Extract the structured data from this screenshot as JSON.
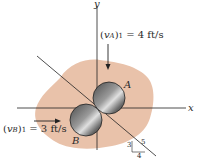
{
  "diagram": {
    "axes": {
      "x_label": "x",
      "y_label": "y"
    },
    "ball_a": {
      "label": "A",
      "velocity_label": "(v_A)_1 = 4 ft/s",
      "velocity_var": "v",
      "velocity_sub": "A",
      "velocity_index": "1",
      "velocity_value": "= 4 ft/s"
    },
    "ball_b": {
      "label": "B",
      "velocity_label": "(v_B)_1 = 3 ft/s",
      "velocity_var": "v",
      "velocity_sub": "B",
      "velocity_index": "1",
      "velocity_value": "= 3 ft/s"
    },
    "slope_triangle": {
      "rise": "3",
      "run": "4",
      "hypotenuse": "5"
    },
    "colors": {
      "surface": "#e9c2aa",
      "ball_dark": "#3a3a3a",
      "ball_light": "#d8d8d8",
      "line": "#222222"
    }
  }
}
